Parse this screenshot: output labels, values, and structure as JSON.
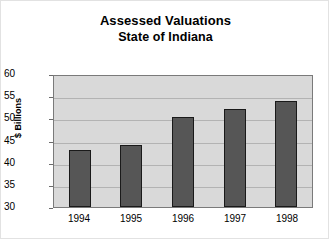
{
  "chart_data": {
    "type": "bar",
    "title": "Assessed Valuations",
    "subtitle": "State of Indiana",
    "title_line1": "Assessed Valuations",
    "title_line2": "State of Indiana",
    "xlabel": "",
    "ylabel": "$ Billions",
    "categories": [
      "1994",
      "1995",
      "1996",
      "1997",
      "1998"
    ],
    "values": [
      42.9,
      44.0,
      50.3,
      52.2,
      54.0
    ],
    "series": [
      {
        "name": "Assessed Valuation",
        "values": [
          42.9,
          44.0,
          50.3,
          52.2,
          54.0
        ]
      }
    ],
    "ylim": [
      30,
      60
    ],
    "ytick_labels": [
      "60",
      "55",
      "50",
      "45",
      "40",
      "35",
      "30"
    ],
    "ytick_values": [
      60,
      55,
      50,
      45,
      40,
      35,
      30
    ],
    "ystep": 5,
    "grid": true,
    "legend": false,
    "legend_position": "none",
    "colors": {
      "bar_fill": "#565656",
      "bar_border": "#1a1a1a",
      "plot_background": "#d9d9d9",
      "gridline": "#b3b3b3",
      "axis": "#7a7a7a",
      "text": "#000000",
      "page_background": "#ffffff",
      "frame_border": "#e2e2e2"
    }
  }
}
